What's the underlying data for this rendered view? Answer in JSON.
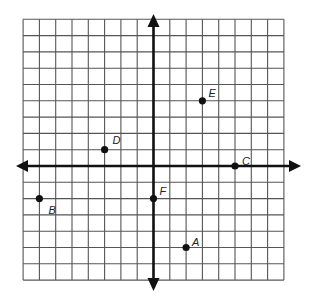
{
  "chart_data": {
    "type": "scatter",
    "title": "",
    "xlabel": "",
    "ylabel": "",
    "xlim": [
      -8,
      8
    ],
    "ylim": [
      -7,
      9
    ],
    "grid": true,
    "grid_step": 1,
    "axes_arrows": true,
    "points": [
      {
        "label": "A",
        "x": 2,
        "y": -5
      },
      {
        "label": "B",
        "x": -7,
        "y": -2
      },
      {
        "label": "C",
        "x": 5,
        "y": 0
      },
      {
        "label": "D",
        "x": -3,
        "y": 1
      },
      {
        "label": "E",
        "x": 3,
        "y": 4
      },
      {
        "label": "F",
        "x": 0,
        "y": -2
      }
    ]
  },
  "colors": {
    "grid": "#555555",
    "axis": "#111111",
    "point": "#111111"
  }
}
